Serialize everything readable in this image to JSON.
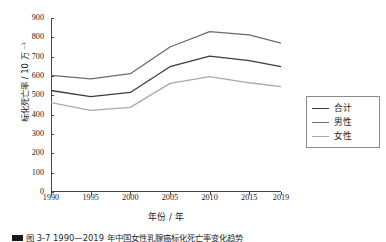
{
  "chart_data": {
    "type": "line",
    "title": "",
    "xlabel": "年份 / 年",
    "ylabel": "标化死亡率 / 10 万 ⁻¹",
    "x": [
      1990,
      1995,
      2000,
      2005,
      2010,
      2015,
      2019
    ],
    "xticklabels": [
      "1990",
      "1995",
      "2000",
      "2005",
      "2010",
      "2015",
      "2019"
    ],
    "yticks": [
      0,
      100,
      200,
      300,
      400,
      500,
      600,
      700,
      800,
      900
    ],
    "yticklabels": [
      "0",
      "100",
      "200",
      "300",
      "400",
      "500",
      "600",
      "700",
      "800",
      "900"
    ],
    "xlim": [
      1990,
      2019
    ],
    "ylim": [
      0,
      900
    ],
    "grid": false,
    "legend_position": "right",
    "series": [
      {
        "name": "合计",
        "color": "#3c3c3c",
        "values": [
          525,
          493,
          515,
          648,
          703,
          680,
          648
        ]
      },
      {
        "name": "男性",
        "color": "#6b6b6b",
        "values": [
          603,
          585,
          612,
          750,
          830,
          813,
          770
        ]
      },
      {
        "name": "女性",
        "color": "#a9a9a9",
        "values": [
          462,
          422,
          438,
          562,
          597,
          565,
          545
        ]
      }
    ]
  },
  "legend": {
    "items": [
      {
        "label": "合计",
        "color": "#3c3c3c"
      },
      {
        "label": "男性",
        "color": "#6b6b6b"
      },
      {
        "label": "女性",
        "color": "#a9a9a9"
      }
    ]
  },
  "caption": {
    "text": "图 3-7 1990—2019 年中国女性乳腺癌标化死亡率变化趋势"
  }
}
